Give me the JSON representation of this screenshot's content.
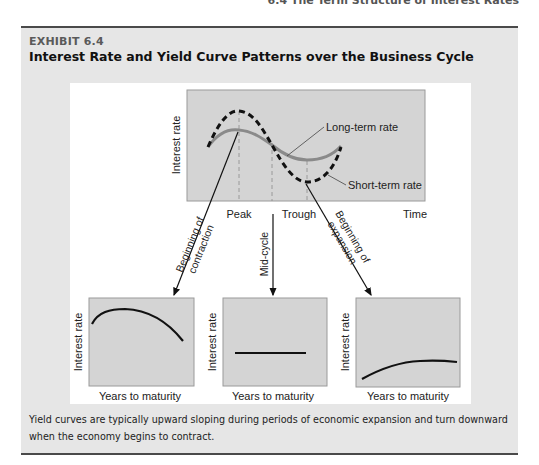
{
  "running_head": "6.4  The Term Structure of Interest Rates",
  "exhibit": {
    "label": "EXHIBIT 6.4",
    "title": "Interest Rate and Yield Curve Patterns over the Business Cycle",
    "caption": "Yield curves are typically upward sloping during periods of economic expansion and turn downward when the economy begins to contract."
  },
  "top_chart": {
    "y_label": "Interest rate",
    "x_ticks": [
      "Peak",
      "Trough"
    ],
    "x_label": "Time",
    "series": [
      {
        "name": "Long-term rate",
        "style": "solid",
        "color": "#8a8a8a"
      },
      {
        "name": "Short-term rate",
        "style": "dashed",
        "color": "#111111"
      }
    ]
  },
  "arrows": [
    {
      "label_line1": "Beginning of",
      "label_line2": "contraction"
    },
    {
      "label_line1": "Mid-cycle",
      "label_line2": ""
    },
    {
      "label_line1": "Beginning of",
      "label_line2": "expansion"
    }
  ],
  "yield_curves": [
    {
      "shape": "downward sloping",
      "y_label": "Interest rate",
      "x_label": "Years to maturity"
    },
    {
      "shape": "flat",
      "y_label": "Interest rate",
      "x_label": "Years to maturity"
    },
    {
      "shape": "upward sloping",
      "y_label": "Interest rate",
      "x_label": "Years to maturity"
    }
  ],
  "colors": {
    "exhibit_bg": "#e6e6e6",
    "plot_bg": "#d4d4d4",
    "rule": "#4a4a4a"
  }
}
